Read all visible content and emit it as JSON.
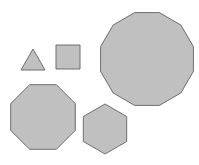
{
  "canvas": {
    "width": 199,
    "height": 165,
    "background": "#ffffff"
  },
  "style": {
    "fill": "#c0c0c0",
    "stroke": "#6e6e6e",
    "stroke_width": 1
  },
  "shapes": [
    {
      "name": "triangle",
      "sides": 3,
      "points": "33,49 45,70 21,70"
    },
    {
      "name": "square",
      "sides": 4,
      "points": "56,45 80,45 80,69 56,69"
    },
    {
      "name": "dodecagon",
      "sides": 12,
      "cx": 147,
      "cy": 59,
      "r": 48
    },
    {
      "name": "octagon",
      "sides": 8,
      "cx": 43,
      "cy": 117,
      "r": 35
    },
    {
      "name": "hexagon",
      "sides": 6,
      "cx": 105,
      "cy": 129,
      "r": 25
    }
  ]
}
